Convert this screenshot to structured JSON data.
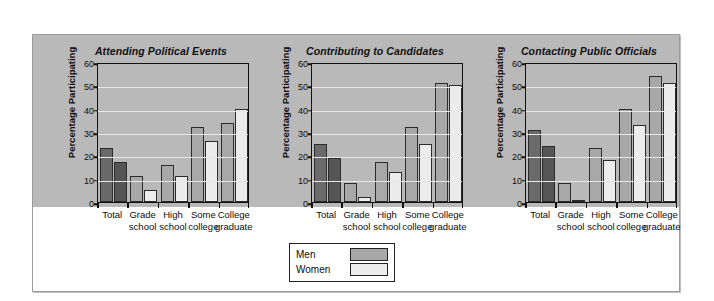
{
  "legend": {
    "men_label": "Men",
    "women_label": "Women",
    "men_color": "#a8a8a8",
    "women_color": "#ececec"
  },
  "axis": {
    "ylabel": "Percentage Participating",
    "yticks": [
      "0",
      "10",
      "20",
      "30",
      "40",
      "50",
      "60"
    ],
    "categories": [
      "Total",
      "Grade school",
      "High school",
      "Some college",
      "College graduate"
    ],
    "category_lines": [
      [
        "Total",
        ""
      ],
      [
        "Grade",
        "school"
      ],
      [
        "High",
        "school"
      ],
      [
        "Some",
        "college"
      ],
      [
        "College",
        "graduate"
      ]
    ]
  },
  "chart_data": [
    {
      "type": "bar",
      "title": "Attending Political Events",
      "xlabel": "",
      "ylabel": "Percentage Participating",
      "ylim": [
        0,
        60
      ],
      "ytick_step": 10,
      "grid": true,
      "legend_position": "bottom-center",
      "categories": [
        "Total",
        "Grade school",
        "High school",
        "Some college",
        "College graduate"
      ],
      "series": [
        {
          "name": "Men",
          "values": [
            23,
            11,
            16,
            32,
            34
          ]
        },
        {
          "name": "Women",
          "values": [
            17,
            5,
            11,
            26,
            40
          ]
        }
      ]
    },
    {
      "type": "bar",
      "title": "Contributing to Candidates",
      "xlabel": "",
      "ylabel": "Percentage Participating",
      "ylim": [
        0,
        60
      ],
      "ytick_step": 10,
      "grid": true,
      "legend_position": "bottom-center",
      "categories": [
        "Total",
        "Grade school",
        "High school",
        "Some college",
        "College graduate"
      ],
      "series": [
        {
          "name": "Men",
          "values": [
            25,
            8,
            17,
            32,
            51
          ]
        },
        {
          "name": "Women",
          "values": [
            19,
            2,
            13,
            25,
            50
          ]
        }
      ]
    },
    {
      "type": "bar",
      "title": "Contacting Public Officials",
      "xlabel": "",
      "ylabel": "Percentage Participating",
      "ylim": [
        0,
        60
      ],
      "ytick_step": 10,
      "grid": true,
      "legend_position": "bottom-center",
      "categories": [
        "Total",
        "Grade school",
        "High school",
        "Some college",
        "College graduate"
      ],
      "series": [
        {
          "name": "Men",
          "values": [
            31,
            8,
            23,
            40,
            54
          ]
        },
        {
          "name": "Women",
          "values": [
            24,
            0.5,
            18,
            33,
            51
          ]
        }
      ]
    }
  ]
}
